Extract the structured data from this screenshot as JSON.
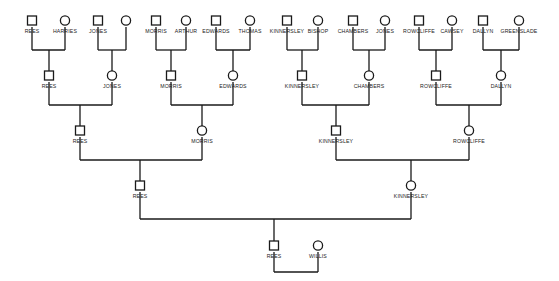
{
  "chart": {
    "type": "pedigree-chart",
    "title": "",
    "width": 559,
    "height": 281,
    "background_color": "#ffffff",
    "line_color": "#1a1a1a",
    "text_color": "#1a1a1a",
    "shape_fill": "#ffffff",
    "symbol_legend": {
      "square": "male",
      "circle": "female"
    },
    "generation_count": 6
  },
  "generations": [
    {
      "index": 0,
      "y": 21,
      "label_y": 33,
      "persons": [
        {
          "id": "g0-1",
          "label": "REES",
          "sex": "male",
          "x": 32
        },
        {
          "id": "g0-2",
          "label": "HARRIES",
          "sex": "female",
          "x": 65
        },
        {
          "id": "g0-3",
          "label": "JONES",
          "sex": "male",
          "x": 98
        },
        {
          "id": "g0-4",
          "label": "",
          "sex": "female",
          "x": 126
        },
        {
          "id": "g0-5",
          "label": "MORRIS",
          "sex": "male",
          "x": 156
        },
        {
          "id": "g0-6",
          "label": "ARTHUR",
          "sex": "female",
          "x": 186
        },
        {
          "id": "g0-7",
          "label": "EDWARDS",
          "sex": "male",
          "x": 216
        },
        {
          "id": "g0-8",
          "label": "THOMAS",
          "sex": "female",
          "x": 250
        },
        {
          "id": "g0-9",
          "label": "KINNERSLEY",
          "sex": "male",
          "x": 287
        },
        {
          "id": "g0-10",
          "label": "BISHOP",
          "sex": "female",
          "x": 318
        },
        {
          "id": "g0-11",
          "label": "CHAMBERS",
          "sex": "male",
          "x": 353
        },
        {
          "id": "g0-12",
          "label": "JONES",
          "sex": "female",
          "x": 385
        },
        {
          "id": "g0-13",
          "label": "ROWCLIFFE",
          "sex": "male",
          "x": 419
        },
        {
          "id": "g0-14",
          "label": "CAWSEY",
          "sex": "female",
          "x": 452
        },
        {
          "id": "g0-15",
          "label": "DALLYN",
          "sex": "male",
          "x": 483
        },
        {
          "id": "g0-16",
          "label": "GREENSLADE",
          "sex": "female",
          "x": 519
        }
      ]
    },
    {
      "index": 1,
      "y": 76,
      "label_y": 88,
      "persons": [
        {
          "id": "g1-1",
          "label": "REES",
          "sex": "male",
          "x": 49
        },
        {
          "id": "g1-2",
          "label": "JONES",
          "sex": "female",
          "x": 112
        },
        {
          "id": "g1-3",
          "label": "MORRIS",
          "sex": "male",
          "x": 171
        },
        {
          "id": "g1-4",
          "label": "EDWARDS",
          "sex": "female",
          "x": 233
        },
        {
          "id": "g1-5",
          "label": "KINNERSLEY",
          "sex": "male",
          "x": 302
        },
        {
          "id": "g1-6",
          "label": "CHAMBERS",
          "sex": "female",
          "x": 369
        },
        {
          "id": "g1-7",
          "label": "ROWCLIFFE",
          "sex": "male",
          "x": 436
        },
        {
          "id": "g1-8",
          "label": "DALLYN",
          "sex": "female",
          "x": 501
        }
      ]
    },
    {
      "index": 2,
      "y": 131,
      "label_y": 143,
      "persons": [
        {
          "id": "g2-1",
          "label": "REES",
          "sex": "male",
          "x": 80
        },
        {
          "id": "g2-2",
          "label": "MORRIS",
          "sex": "female",
          "x": 202
        },
        {
          "id": "g2-3",
          "label": "KINNERSLEY",
          "sex": "male",
          "x": 336
        },
        {
          "id": "g2-4",
          "label": "ROWCLIFFE",
          "sex": "female",
          "x": 469
        }
      ]
    },
    {
      "index": 3,
      "y": 186,
      "label_y": 198,
      "persons": [
        {
          "id": "g3-1",
          "label": "REES",
          "sex": "male",
          "x": 140
        },
        {
          "id": "g3-2",
          "label": "KINNERSLEY",
          "sex": "female",
          "x": 411
        }
      ]
    },
    {
      "index": 4,
      "y": 246,
      "label_y": 258,
      "persons": [
        {
          "id": "g4-1",
          "label": "REES",
          "sex": "male",
          "x": 274
        },
        {
          "id": "g4-2",
          "label": "WILLIS",
          "sex": "female",
          "x": 318
        }
      ]
    }
  ],
  "unions": [
    {
      "id": "u0-1",
      "left_x": 32,
      "right_x": 65,
      "bar_y": 50,
      "parent_y": 27,
      "child_x": 49,
      "child_y": 71
    },
    {
      "id": "u0-2",
      "left_x": 98,
      "right_x": 126,
      "bar_y": 50,
      "parent_y": 27,
      "child_x": 112,
      "child_y": 71
    },
    {
      "id": "u0-3",
      "left_x": 156,
      "right_x": 186,
      "bar_y": 50,
      "parent_y": 27,
      "child_x": 171,
      "child_y": 71
    },
    {
      "id": "u0-4",
      "left_x": 216,
      "right_x": 250,
      "bar_y": 50,
      "parent_y": 27,
      "child_x": 233,
      "child_y": 71
    },
    {
      "id": "u0-5",
      "left_x": 287,
      "right_x": 318,
      "bar_y": 50,
      "parent_y": 27,
      "child_x": 302,
      "child_y": 71
    },
    {
      "id": "u0-6",
      "left_x": 353,
      "right_x": 385,
      "bar_y": 50,
      "parent_y": 27,
      "child_x": 369,
      "child_y": 71
    },
    {
      "id": "u0-7",
      "left_x": 419,
      "right_x": 452,
      "bar_y": 50,
      "parent_y": 27,
      "child_x": 436,
      "child_y": 71
    },
    {
      "id": "u0-8",
      "left_x": 483,
      "right_x": 519,
      "bar_y": 50,
      "parent_y": 27,
      "child_x": 501,
      "child_y": 71
    },
    {
      "id": "u1-1",
      "left_x": 49,
      "right_x": 112,
      "bar_y": 105,
      "parent_y": 82,
      "child_x": 80,
      "child_y": 126
    },
    {
      "id": "u1-2",
      "left_x": 171,
      "right_x": 233,
      "bar_y": 105,
      "parent_y": 82,
      "child_x": 202,
      "child_y": 126
    },
    {
      "id": "u1-3",
      "left_x": 302,
      "right_x": 369,
      "bar_y": 105,
      "parent_y": 82,
      "child_x": 336,
      "child_y": 126
    },
    {
      "id": "u1-4",
      "left_x": 436,
      "right_x": 501,
      "bar_y": 105,
      "parent_y": 82,
      "child_x": 469,
      "child_y": 126
    },
    {
      "id": "u2-1",
      "left_x": 80,
      "right_x": 202,
      "bar_y": 160,
      "parent_y": 137,
      "child_x": 140,
      "child_y": 181
    },
    {
      "id": "u2-2",
      "left_x": 336,
      "right_x": 469,
      "bar_y": 160,
      "parent_y": 137,
      "child_x": 411,
      "child_y": 181
    },
    {
      "id": "u3-1",
      "left_x": 140,
      "right_x": 411,
      "bar_y": 219,
      "parent_y": 192,
      "child_x": 274,
      "child_y": 241
    },
    {
      "id": "u4-1",
      "left_x": 274,
      "right_x": 318,
      "bar_y": 272,
      "parent_y": 252,
      "child_x": null,
      "child_y": null
    }
  ]
}
